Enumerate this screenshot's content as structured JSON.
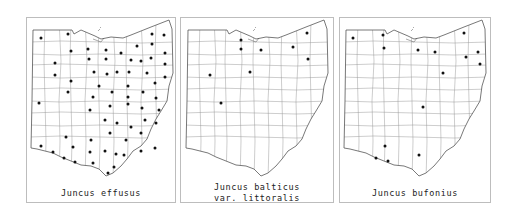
{
  "figure": {
    "maps": [
      {
        "id": "effusus",
        "caption_lines": [
          "Juncus effusus"
        ],
        "frame": {
          "left": 26,
          "width": 150
        },
        "dots": [
          [
            40,
            37
          ],
          [
            67,
            33
          ],
          [
            70,
            50
          ],
          [
            87,
            48
          ],
          [
            105,
            49
          ],
          [
            120,
            52
          ],
          [
            136,
            45
          ],
          [
            151,
            33
          ],
          [
            163,
            34
          ],
          [
            151,
            43
          ],
          [
            88,
            58
          ],
          [
            105,
            58
          ],
          [
            130,
            59
          ],
          [
            140,
            60
          ],
          [
            150,
            57
          ],
          [
            164,
            52
          ],
          [
            54,
            62
          ],
          [
            93,
            71
          ],
          [
            106,
            73
          ],
          [
            116,
            71
          ],
          [
            128,
            71
          ],
          [
            146,
            72
          ],
          [
            164,
            63
          ],
          [
            54,
            74
          ],
          [
            70,
            80
          ],
          [
            98,
            85
          ],
          [
            111,
            91
          ],
          [
            127,
            85
          ],
          [
            142,
            91
          ],
          [
            154,
            82
          ],
          [
            164,
            76
          ],
          [
            67,
            91
          ],
          [
            92,
            96
          ],
          [
            127,
            96
          ],
          [
            155,
            97
          ],
          [
            38,
            102
          ],
          [
            89,
            109
          ],
          [
            109,
            105
          ],
          [
            127,
            103
          ],
          [
            141,
            107
          ],
          [
            158,
            109
          ],
          [
            104,
            119
          ],
          [
            116,
            122
          ],
          [
            130,
            126
          ],
          [
            144,
            119
          ],
          [
            155,
            122
          ],
          [
            109,
            132
          ],
          [
            125,
            139
          ],
          [
            140,
            132
          ],
          [
            65,
            136
          ],
          [
            90,
            139
          ],
          [
            140,
            150
          ],
          [
            154,
            147
          ],
          [
            72,
            146
          ],
          [
            40,
            145
          ],
          [
            52,
            151
          ],
          [
            63,
            157
          ],
          [
            74,
            161
          ],
          [
            89,
            151
          ],
          [
            104,
            150
          ],
          [
            123,
            154
          ],
          [
            115,
            153
          ],
          [
            92,
            162
          ],
          [
            113,
            166
          ],
          [
            107,
            172
          ]
        ]
      },
      {
        "id": "balticus",
        "caption_lines": [
          "Juncus balticus",
          "var. littoralis"
        ],
        "frame": {
          "left": 180,
          "width": 154
        },
        "dots": [
          [
            240,
            39
          ],
          [
            240,
            48
          ],
          [
            260,
            49
          ],
          [
            292,
            46
          ],
          [
            306,
            32
          ],
          [
            307,
            58
          ],
          [
            209,
            74
          ],
          [
            249,
            71
          ],
          [
            220,
            102
          ]
        ]
      },
      {
        "id": "bufonius",
        "caption_lines": [
          "Juncus bufonius"
        ],
        "frame": {
          "left": 339,
          "width": 152
        },
        "dots": [
          [
            352,
            37
          ],
          [
            382,
            34
          ],
          [
            383,
            47
          ],
          [
            417,
            49
          ],
          [
            434,
            51
          ],
          [
            463,
            32
          ],
          [
            477,
            51
          ],
          [
            465,
            56
          ],
          [
            479,
            63
          ],
          [
            442,
            72
          ],
          [
            422,
            106
          ],
          [
            384,
            145
          ],
          [
            375,
            157
          ],
          [
            387,
            160
          ],
          [
            418,
            154
          ]
        ]
      }
    ],
    "colors": {
      "frame": "#bdbdbd",
      "outline": "#555555",
      "county": "#9a9a9a",
      "dot": "#111111",
      "text": "#222222"
    }
  }
}
